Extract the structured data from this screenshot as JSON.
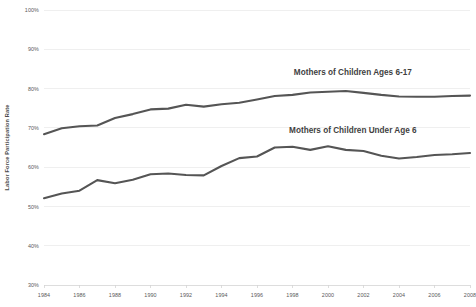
{
  "chart_data": {
    "type": "line",
    "title": "",
    "xlabel": "",
    "ylabel": "Labor Force Participation Rate",
    "ylim": [
      30,
      100
    ],
    "xlim": [
      1984,
      2008
    ],
    "grid": true,
    "legend_position": "inline-annotation",
    "ytick_labels": [
      "100%",
      "90%",
      "80%",
      "70%",
      "60%",
      "50%",
      "40%",
      "30%"
    ],
    "ytick_values": [
      100,
      90,
      80,
      70,
      60,
      50,
      40,
      30
    ],
    "xtick_labels": [
      "1984",
      "1986",
      "1988",
      "1990",
      "1992",
      "1994",
      "1996",
      "1998",
      "2000",
      "2002",
      "2004",
      "2006",
      "2008"
    ],
    "xtick_values": [
      1984,
      1986,
      1988,
      1990,
      1992,
      1994,
      1996,
      1998,
      2000,
      2002,
      2004,
      2006,
      2008
    ],
    "x": [
      1984,
      1985,
      1986,
      1987,
      1988,
      1989,
      1990,
      1991,
      1992,
      1993,
      1994,
      1995,
      1996,
      1997,
      1998,
      1999,
      2000,
      2001,
      2002,
      2003,
      2004,
      2005,
      2006,
      2007,
      2008
    ],
    "series": [
      {
        "name": "Mothers of Children Ages 6-17",
        "color": "#555555",
        "values": [
          68.4,
          69.9,
          70.4,
          70.6,
          72.5,
          73.5,
          74.7,
          74.9,
          75.9,
          75.4,
          76.0,
          76.4,
          77.2,
          78.1,
          78.4,
          79.0,
          79.2,
          79.4,
          78.9,
          78.4,
          78.0,
          77.9,
          77.9,
          78.1,
          78.2
        ]
      },
      {
        "name": "Mothers of Children Under Age 6",
        "color": "#555555",
        "values": [
          52.1,
          53.3,
          54.0,
          56.7,
          55.9,
          56.8,
          58.2,
          58.4,
          58.0,
          57.9,
          60.3,
          62.3,
          62.7,
          65.0,
          65.2,
          64.4,
          65.3,
          64.4,
          64.1,
          62.9,
          62.2,
          62.6,
          63.1,
          63.3,
          63.6
        ]
      }
    ],
    "annotations": [
      {
        "text": "Mothers of Children Ages 6-17",
        "x": 2001.4,
        "y": 83.5
      },
      {
        "text": "Mothers of Children Under Age 6",
        "x": 2001.4,
        "y": 68.7
      }
    ]
  }
}
